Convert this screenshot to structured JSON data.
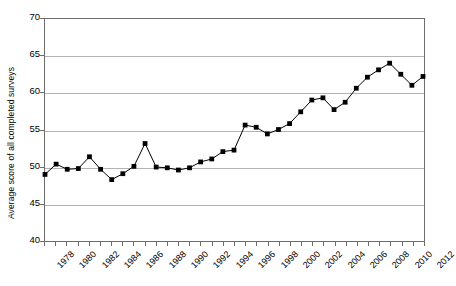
{
  "chart_data": {
    "type": "line",
    "title": "",
    "xlabel": "",
    "ylabel": "Average score of all completed surveys",
    "ylim": [
      40,
      70
    ],
    "ytick_values": [
      40,
      45,
      50,
      55,
      60,
      65,
      70
    ],
    "ytick_labels": [
      "40",
      "45",
      "50",
      "55",
      "60",
      "65",
      "70"
    ],
    "xlim": [
      1978,
      2012
    ],
    "xtick_values": [
      1978,
      1980,
      1982,
      1984,
      1986,
      1988,
      1990,
      1992,
      1994,
      1996,
      1998,
      2000,
      2002,
      2004,
      2006,
      2008,
      2010,
      2012
    ],
    "xtick_labels": [
      "1978",
      "1980",
      "1982",
      "1984",
      "1986",
      "1988",
      "1990",
      "1992",
      "1994",
      "1996",
      "1998",
      "2000",
      "2002",
      "2004",
      "2006",
      "2008",
      "2010",
      "2012"
    ],
    "grid": "horizontal",
    "legend": "none",
    "marker": "square",
    "marker_color": "#000000",
    "line_color": "#000000",
    "x": [
      1978,
      1979,
      1980,
      1981,
      1982,
      1983,
      1984,
      1985,
      1986,
      1987,
      1988,
      1989,
      1990,
      1991,
      1992,
      1993,
      1994,
      1995,
      1996,
      1997,
      1998,
      1999,
      2000,
      2001,
      2002,
      2003,
      2004,
      2005,
      2006,
      2007,
      2008,
      2009,
      2010,
      2011,
      2012
    ],
    "values": [
      48.9,
      50.3,
      49.6,
      49.7,
      51.3,
      49.6,
      48.2,
      49.0,
      50.0,
      53.1,
      49.9,
      49.8,
      49.5,
      49.8,
      50.6,
      51.0,
      52.0,
      52.2,
      55.6,
      55.3,
      54.4,
      55.0,
      55.8,
      57.4,
      59.0,
      59.3,
      57.7,
      58.7,
      60.6,
      62.1,
      63.1,
      64.0,
      62.5,
      61.0,
      62.2
    ]
  },
  "axis": {
    "y_title": "Average score of all completed surveys"
  }
}
